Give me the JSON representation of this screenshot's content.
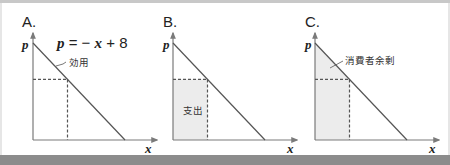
{
  "colors": {
    "axis": "#7a7a7a",
    "demand_line": "#555555",
    "dashed": "#555555",
    "shade": "#ececec",
    "text": "#222222"
  },
  "panels": [
    {
      "id": "A",
      "label": "A.",
      "y_axis_label": "p",
      "x_axis_label": "x",
      "equation": {
        "lhs": "p",
        "eq": " = − ",
        "var": "x",
        "rest": " + 8"
      },
      "annotation": "効用",
      "shading": "none"
    },
    {
      "id": "B",
      "label": "B.",
      "y_axis_label": "p",
      "x_axis_label": "x",
      "annotation": "支出",
      "shading": "rectangle"
    },
    {
      "id": "C",
      "label": "C.",
      "y_axis_label": "p",
      "x_axis_label": "x",
      "annotation": "消費者余剰",
      "shading": "triangle-and-rectangle"
    }
  ],
  "chart_data": {
    "type": "line",
    "title": "",
    "demand": {
      "intercept": 8,
      "slope": -1
    },
    "point": {
      "x": 3,
      "p": 5
    },
    "xlim": [
      0,
      8
    ],
    "ylim": [
      0,
      8
    ],
    "xlabel": "x",
    "ylabel": "p"
  }
}
